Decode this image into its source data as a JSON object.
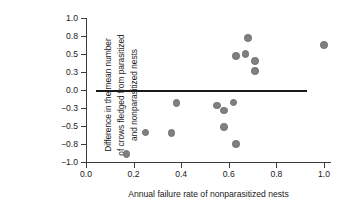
{
  "chart_data": {
    "type": "scatter",
    "title": "",
    "xlabel": "Annual failure rate of nonparasitized nests",
    "ylabel": "Difference in the mean number of crows fledged from parasitized and nonparasitized nests",
    "ylabel_lines": [
      "Difference in the mean number",
      "of crows fledged from parasitized",
      "and nonparasitized nests"
    ],
    "xlim": [
      0.0,
      1.03
    ],
    "ylim": [
      -1.0,
      1.0
    ],
    "xticks": [
      0.0,
      0.2,
      0.4,
      0.6,
      0.8,
      1.0
    ],
    "xticklabels": [
      "0.0",
      "0.2",
      "0.4",
      "0.6",
      "0.8",
      "1.0"
    ],
    "yticks": [
      1.0,
      0.8,
      0.5,
      0.3,
      0.0,
      -0.3,
      -0.5,
      -0.8,
      -1.0
    ],
    "yticklabels": [
      "1.0",
      "0.8",
      "0.5",
      "0.3",
      "0.0",
      "−0.3",
      "−0.5",
      "−0.8",
      "−1.0"
    ],
    "grid": false,
    "legend": false,
    "reference_line": {
      "y": 0.0,
      "x_start": 0.04,
      "x_end": 0.93,
      "color": "#1a1a1a"
    },
    "marker": {
      "color": "#808080",
      "edge_color": "#6e6e6e",
      "shape": "circle",
      "size": 7.6
    },
    "points": [
      {
        "x": 0.17,
        "y": -0.91
      },
      {
        "x": 0.25,
        "y": -0.61
      },
      {
        "x": 0.36,
        "y": -0.62
      },
      {
        "x": 0.38,
        "y": -0.22
      },
      {
        "x": 0.55,
        "y": -0.26
      },
      {
        "x": 0.58,
        "y": -0.33
      },
      {
        "x": 0.58,
        "y": -0.52
      },
      {
        "x": 0.62,
        "y": -0.21
      },
      {
        "x": 0.63,
        "y": -0.8
      },
      {
        "x": 0.63,
        "y": 0.48
      },
      {
        "x": 0.67,
        "y": 0.5
      },
      {
        "x": 0.68,
        "y": 0.77
      },
      {
        "x": 0.71,
        "y": 0.42
      },
      {
        "x": 0.71,
        "y": 0.31
      },
      {
        "x": 1.0,
        "y": 0.65
      }
    ]
  },
  "axes_pixels": {
    "x0_px": 86,
    "x_per_unit_px": 238.0,
    "y_top_px": 18,
    "y_bottom_px": 162,
    "y_tick_step_px": 18
  }
}
